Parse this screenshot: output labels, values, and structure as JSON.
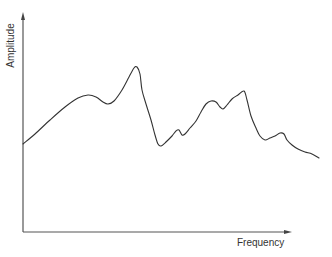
{
  "chart_data": {
    "type": "line",
    "title": "",
    "xlabel": "Frequency",
    "ylabel": "Amplitude",
    "grid": false,
    "legend": null,
    "ticks": {
      "x": [],
      "y": []
    },
    "axis_style": "arrows, no tick marks",
    "series": [
      {
        "name": "spectrum",
        "color": "#333333",
        "points_px": [
          [
            23,
            144
          ],
          [
            35,
            134
          ],
          [
            50,
            120
          ],
          [
            65,
            107
          ],
          [
            78,
            98
          ],
          [
            88,
            95
          ],
          [
            96,
            97
          ],
          [
            103,
            102
          ],
          [
            108,
            104
          ],
          [
            114,
            101
          ],
          [
            122,
            90
          ],
          [
            129,
            77
          ],
          [
            134,
            68
          ],
          [
            137,
            67
          ],
          [
            140,
            74
          ],
          [
            142,
            90
          ],
          [
            146,
            104
          ],
          [
            151,
            120
          ],
          [
            155,
            135
          ],
          [
            158,
            144
          ],
          [
            161,
            146
          ],
          [
            166,
            142
          ],
          [
            172,
            136
          ],
          [
            176,
            131
          ],
          [
            179,
            130
          ],
          [
            182,
            135
          ],
          [
            185,
            134
          ],
          [
            190,
            128
          ],
          [
            196,
            121
          ],
          [
            201,
            112
          ],
          [
            206,
            104
          ],
          [
            211,
            101
          ],
          [
            216,
            102
          ],
          [
            220,
            107
          ],
          [
            223,
            109
          ],
          [
            227,
            105
          ],
          [
            232,
            99
          ],
          [
            238,
            95
          ],
          [
            244,
            91
          ],
          [
            247,
            100
          ],
          [
            251,
            116
          ],
          [
            256,
            128
          ],
          [
            260,
            136
          ],
          [
            265,
            140
          ],
          [
            270,
            138
          ],
          [
            275,
            136
          ],
          [
            280,
            133
          ],
          [
            284,
            134
          ],
          [
            287,
            140
          ],
          [
            292,
            145
          ],
          [
            298,
            149
          ],
          [
            305,
            152
          ],
          [
            312,
            154
          ],
          [
            319,
            158
          ]
        ],
        "description": "Irregular amplitude spectrum with two major peaks (mid-low frequency and mid-high frequency), decaying at high frequency"
      }
    ]
  },
  "axes": {
    "x_label": "Frequency",
    "y_label": "Amplitude",
    "color": "#555555"
  }
}
